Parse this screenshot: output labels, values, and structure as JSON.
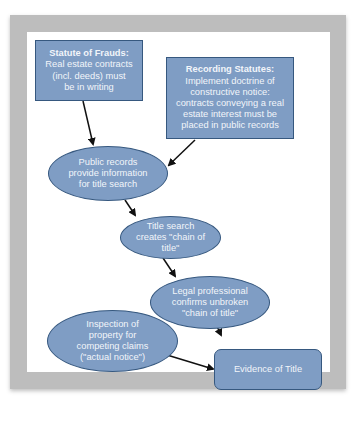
{
  "diagram": {
    "nodes": [
      {
        "id": "statute-of-frauds",
        "shape": "rectangle",
        "title": "Statute of Frauds:",
        "lines": [
          "Real estate contracts",
          "(incl. deeds) must",
          "be in writing"
        ]
      },
      {
        "id": "recording-statutes",
        "shape": "rectangle",
        "title": "Recording Statutes:",
        "lines": [
          "Implement doctrine of",
          "constructive notice:",
          "contracts conveying a real",
          "estate interest must be",
          "placed in public records"
        ]
      },
      {
        "id": "public-records",
        "shape": "ellipse",
        "lines": [
          "Public records",
          "provide information",
          "for title search"
        ]
      },
      {
        "id": "title-search",
        "shape": "ellipse",
        "lines": [
          "Title search",
          "creates \"chain of",
          "title\""
        ]
      },
      {
        "id": "legal-professional",
        "shape": "ellipse",
        "lines": [
          "Legal professional",
          "confirms unbroken",
          "\"chain of title\""
        ]
      },
      {
        "id": "inspection",
        "shape": "ellipse",
        "lines": [
          "Inspection of",
          "property for",
          "competing claims",
          "(\"actual notice\")"
        ]
      },
      {
        "id": "evidence-of-title",
        "shape": "rounded-rectangle",
        "lines": [
          "Evidence of Title"
        ]
      }
    ],
    "edges": [
      {
        "from": "statute-of-frauds",
        "to": "public-records"
      },
      {
        "from": "recording-statutes",
        "to": "public-records"
      },
      {
        "from": "public-records",
        "to": "title-search"
      },
      {
        "from": "title-search",
        "to": "legal-professional"
      },
      {
        "from": "legal-professional",
        "to": "evidence-of-title"
      },
      {
        "from": "inspection",
        "to": "evidence-of-title"
      }
    ],
    "colors": {
      "node_fill": "#7f9dc4",
      "node_border": "#36587f",
      "node_text": "#f2f5fa",
      "arrow": "#111111",
      "frame": "#bdbdbd"
    }
  }
}
